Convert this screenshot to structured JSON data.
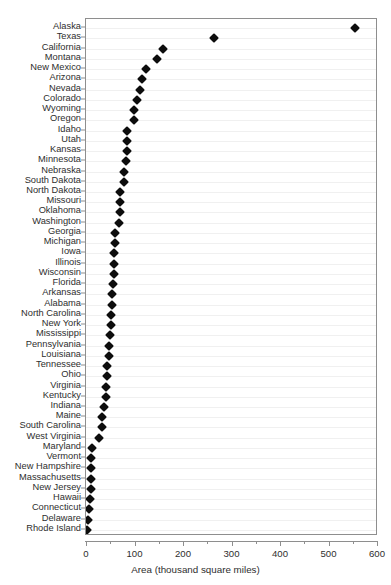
{
  "chart_data": {
    "type": "scatter",
    "plot_style": "cleveland-dot-plot",
    "title": "",
    "subtitle": "",
    "xlabel": "Area (thousand square miles)",
    "ylabel": "",
    "xlim": [
      0,
      600
    ],
    "xticks": [
      0,
      100,
      200,
      300,
      400,
      500,
      600
    ],
    "xticklabels": [
      "0",
      "100",
      "200",
      "300",
      "400",
      "500",
      "600"
    ],
    "minor_xticks": [
      50,
      150,
      250,
      350,
      450,
      550
    ],
    "grid": "horizontal",
    "legend": "none",
    "marker": "diamond",
    "marker_color": "#0d0d0d",
    "sort": "descending",
    "categories": [
      "Alaska",
      "Texas",
      "California",
      "Montana",
      "New Mexico",
      "Arizona",
      "Nevada",
      "Colorado",
      "Wyoming",
      "Oregon",
      "Idaho",
      "Utah",
      "Kansas",
      "Minnesota",
      "Nebraska",
      "South Dakota",
      "North Dakota",
      "Missouri",
      "Oklahoma",
      "Washington",
      "Georgia",
      "Michigan",
      "Iowa",
      "Illinois",
      "Wisconsin",
      "Florida",
      "Arkansas",
      "Alabama",
      "North Carolina",
      "New York",
      "Mississippi",
      "Pennsylvania",
      "Louisiana",
      "Tennessee",
      "Ohio",
      "Virginia",
      "Kentucky",
      "Indiana",
      "Maine",
      "South Carolina",
      "West Virginia",
      "Maryland",
      "Vermont",
      "New Hampshire",
      "Massachusetts",
      "New Jersey",
      "Hawaii",
      "Connecticut",
      "Delaware",
      "Rhode Island"
    ],
    "values": [
      552,
      262,
      156,
      145,
      121,
      113,
      109,
      104,
      97,
      96,
      83,
      82,
      82,
      80,
      77,
      76,
      69,
      69,
      68,
      66,
      58,
      57,
      56,
      56,
      55,
      54,
      52,
      51,
      49,
      49,
      47,
      45,
      45,
      42,
      41,
      40,
      40,
      36,
      31,
      30,
      24,
      10,
      9,
      9,
      8,
      8,
      6,
      5,
      2,
      1
    ],
    "value_unit": "thousand square miles",
    "n_categories": 50
  }
}
